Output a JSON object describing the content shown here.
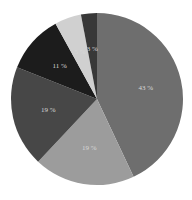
{
  "chart_data": {
    "type": "pie",
    "title": "",
    "categories": [
      "Slice 1",
      "Slice 2",
      "Slice 3",
      "Slice 4",
      "Slice 5",
      "Slice 6"
    ],
    "values": [
      43,
      19,
      19,
      11,
      5,
      3
    ],
    "labels": [
      "43 %",
      "19 %",
      "19 %",
      "11 %",
      "5 %",
      "3 %"
    ],
    "colors": [
      "#6e6e6e",
      "#9c9c9c",
      "#474747",
      "#1c1c1c",
      "#d0d0d0",
      "#383838"
    ],
    "start_angle_deg": 0,
    "direction": "clockwise",
    "legend": "none"
  },
  "geometry": {
    "cx": 97,
    "cy": 99,
    "r": 86
  }
}
